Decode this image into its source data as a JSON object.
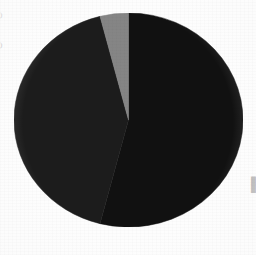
{
  "figure": {
    "background_color": "#fdfdfd",
    "center_x": 128,
    "center_y": 120,
    "radius_x": 114,
    "radius_y": 107
  },
  "edge_labels": {
    "left_upper": ")",
    "left_lower": ")",
    "right_line1": "█",
    "right_line2": "█"
  },
  "chart_data": {
    "type": "pie",
    "title": "",
    "subtitle": "",
    "xlabel": "",
    "ylabel": "",
    "grid": false,
    "legend_position": "right-clipped",
    "start_angle_deg": 0,
    "direction": "clockwise",
    "categories": [
      "Slice 1",
      "Slice 2",
      "Slice 3"
    ],
    "values": [
      54,
      42,
      4
    ],
    "units": "percent",
    "colors": [
      "#111111",
      "#1c1c1c",
      "#858585"
    ],
    "slices": [
      {
        "label": "Slice 1",
        "value": 54,
        "percent": 54,
        "color": "#111111",
        "start_angle_deg": 0,
        "end_angle_deg": 194.4
      },
      {
        "label": "Slice 2",
        "value": 42,
        "percent": 42,
        "color": "#1c1c1c",
        "start_angle_deg": 194.4,
        "end_angle_deg": 345.6
      },
      {
        "label": "Slice 3",
        "value": 4,
        "percent": 4,
        "color": "#858585",
        "start_angle_deg": 345.6,
        "end_angle_deg": 360
      }
    ]
  }
}
